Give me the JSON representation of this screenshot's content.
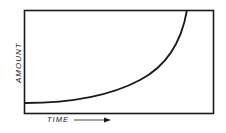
{
  "chart_data": {
    "type": "line",
    "title": "",
    "xlabel": "TIME",
    "ylabel": "AMOUNT",
    "x_axis_arrow": true,
    "grid": false,
    "legend": null,
    "x": [
      0,
      10,
      20,
      30,
      40,
      50,
      60,
      70,
      80,
      85,
      88
    ],
    "values": [
      0,
      0.5,
      2,
      5,
      9,
      15,
      24,
      38,
      60,
      80,
      100
    ],
    "xlim": [
      0,
      100
    ],
    "ylim": [
      0,
      100
    ],
    "colors": {
      "line": "#1a1a1a",
      "frame": "#1a1a1a",
      "background": "#ffffff"
    }
  },
  "labels": {
    "y": "AMOUNT",
    "x": "TIME"
  }
}
